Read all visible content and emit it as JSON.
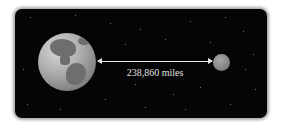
{
  "diagram": {
    "type": "earth-moon-distance",
    "distance_label": "238,860 miles",
    "objects": [
      {
        "name": "Earth",
        "role": "planet"
      },
      {
        "name": "Moon",
        "role": "satellite"
      }
    ],
    "colors": {
      "background": "#050505",
      "arrow": "#e8e8e8",
      "label": "#e0e0e0"
    }
  }
}
